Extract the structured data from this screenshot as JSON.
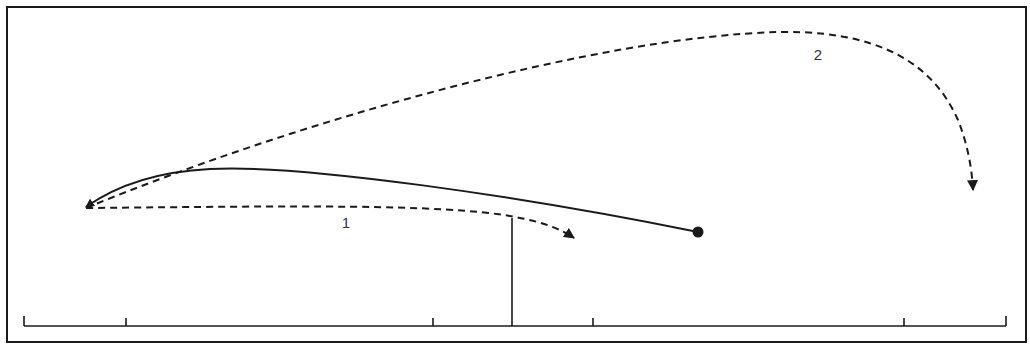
{
  "diagram": {
    "type": "trajectory-diagram",
    "colors": {
      "background": "#ffffff",
      "stroke": "#1a1a1a",
      "label": "#333333"
    },
    "frame": {
      "x": 7,
      "y": 7,
      "width": 1019,
      "height": 335
    },
    "scale": {
      "baseline_y": 326,
      "x_start": 24,
      "x_end": 1006,
      "ticks_x": [
        24,
        126,
        433,
        593,
        904,
        1006
      ],
      "tick_height": 8
    },
    "post": {
      "x": 512,
      "y_top": 218,
      "y_bottom": 326
    },
    "solid_path": {
      "start_marker": "dot",
      "start": [
        698,
        232
      ],
      "end_marker": "arrowhead",
      "end": [
        84,
        208
      ]
    },
    "arrows": [
      {
        "label": "1",
        "style": "dashed",
        "start": [
          84,
          208
        ],
        "end": [
          575,
          238
        ],
        "label_pos": [
          346,
          222
        ]
      },
      {
        "label": "2",
        "style": "dashed",
        "start": [
          84,
          208
        ],
        "end": [
          973,
          190
        ],
        "label_pos": [
          818,
          55
        ]
      }
    ]
  }
}
